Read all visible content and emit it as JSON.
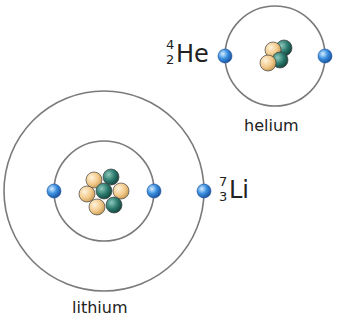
{
  "atoms": [
    {
      "name": "helium",
      "symbol": "He",
      "mass_number": "4",
      "atomic_number": "2",
      "protons": 2,
      "neutrons": 2,
      "electrons": 2,
      "shells": 1
    },
    {
      "name": "lithium",
      "symbol": "Li",
      "mass_number": "7",
      "atomic_number": "3",
      "protons": 3,
      "neutrons": 4,
      "electrons": 3,
      "shells": 2
    }
  ],
  "colors": {
    "orbit": "#7a7a7a",
    "electron": "#3a8fe0",
    "proton": "#f2c98a",
    "neutron": "#2c7a6e"
  }
}
